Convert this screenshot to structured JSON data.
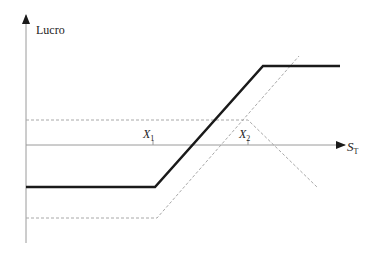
{
  "diagram": {
    "type": "payoff-diagram",
    "y_axis_label": "Lucro",
    "x_axis_label": {
      "main": "S",
      "sub": "T"
    },
    "strikes": [
      {
        "main": "X",
        "sub": "1"
      },
      {
        "main": "X",
        "sub": "2"
      }
    ],
    "colors": {
      "axis": "#9a9a9a",
      "profit_line": "#1a1a1a",
      "component_lines": "#a8a8a8",
      "text": "#222222"
    },
    "lines": {
      "profit": [
        [
          26,
          187
        ],
        [
          155,
          187
        ],
        [
          263,
          66
        ],
        [
          340,
          66
        ]
      ],
      "long_call_component": [
        [
          26,
          218
        ],
        [
          157,
          218
        ],
        [
          299,
          56
        ]
      ],
      "short_call_component": [
        [
          26,
          120
        ],
        [
          248,
          120
        ],
        [
          317,
          187
        ]
      ]
    }
  }
}
